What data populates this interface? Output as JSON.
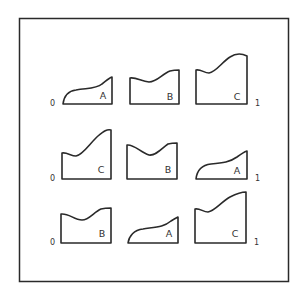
{
  "figure": {
    "frame": {
      "x": 19,
      "y": 18,
      "w": 269,
      "h": 263
    },
    "colors": {
      "stroke": "#2a2a2a",
      "text": "#333333",
      "background": "#ffffff"
    },
    "rows": [
      {
        "index": 1,
        "left_label": "0",
        "right_label": "1",
        "shapes": [
          {
            "label": "A",
            "type": "curve-A"
          },
          {
            "label": "B",
            "type": "curve-B"
          },
          {
            "label": "C",
            "type": "curve-C"
          }
        ]
      },
      {
        "index": 2,
        "left_label": "0",
        "right_label": "1",
        "shapes": [
          {
            "label": "C",
            "type": "curve-C"
          },
          {
            "label": "B",
            "type": "curve-B"
          },
          {
            "label": "A",
            "type": "curve-A"
          }
        ]
      },
      {
        "index": 3,
        "left_label": "0",
        "right_label": "1",
        "shapes": [
          {
            "label": "B",
            "type": "curve-B"
          },
          {
            "label": "A",
            "type": "curve-A"
          },
          {
            "label": "C",
            "type": "curve-C"
          }
        ]
      }
    ]
  }
}
